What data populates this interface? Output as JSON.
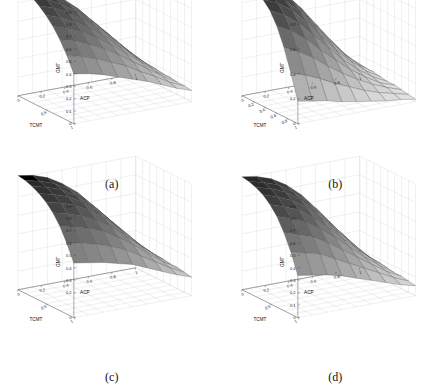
{
  "figure": {
    "background": "#ffffff",
    "layout": "2x2 grid of 3D surface plots",
    "panels": [
      {
        "caption": "(a)",
        "zlabel": "GMT",
        "xlabel": "ACP",
        "ylabel": "TCMT",
        "zticks": [
          "0",
          "0.1",
          "0.2",
          "0.3",
          "0.4",
          "0.5",
          "0.6",
          "0.7",
          "0.8",
          "0.9"
        ],
        "xticks": [
          "0",
          "0.2",
          "0.4",
          "0.6",
          "0.8",
          "1"
        ],
        "yticks": [
          "0.5",
          "1"
        ]
      },
      {
        "caption": "(b)",
        "zlabel": "GMT",
        "xlabel": "ACP",
        "ylabel": "TCMT",
        "zticks": [
          "0",
          "0.2",
          "0.4",
          "0.6",
          "0.8"
        ],
        "xticks": [
          "0",
          "0.2",
          "0.4",
          "0.6",
          "0.8",
          "1"
        ],
        "yticks": [
          "0.2",
          "0.4",
          "0.6",
          "0.8",
          "1"
        ]
      },
      {
        "caption": "(c)",
        "zlabel": "GMT",
        "xlabel": "ACP",
        "ylabel": "TCMT",
        "zticks": [
          "0",
          "0.2",
          "0.3",
          "0.4",
          "0.5",
          "0.6",
          "0.7",
          "0.8",
          "0.9"
        ],
        "xticks": [
          "0",
          "0.2",
          "0.4",
          "0.6",
          "0.8",
          "1"
        ],
        "yticks": [
          "0.5",
          "1"
        ]
      },
      {
        "caption": "(d)",
        "zlabel": "GMT",
        "xlabel": "ACP",
        "ylabel": "TCMT",
        "zticks": [
          "0",
          "0.1",
          "0.2",
          "0.3",
          "0.4",
          "0.5",
          "0.6",
          "0.7",
          "0.8",
          "0.9"
        ],
        "xticks": [
          "0",
          "0.2",
          "0.4",
          "0.6",
          "0.8",
          "1"
        ],
        "yticks": [
          "0.5",
          "1"
        ]
      }
    ]
  },
  "chart_data": [
    {
      "type": "surface",
      "panel": "(a)",
      "title": "",
      "xlabel": "ACP",
      "ylabel": "TCMT",
      "zlabel": "GMT",
      "xlim": [
        0,
        1
      ],
      "ylim": [
        0,
        1
      ],
      "zlim": [
        0,
        0.9
      ],
      "grid": true,
      "colormap": "gray",
      "x": [
        0,
        0.125,
        0.25,
        0.375,
        0.5,
        0.625,
        0.75,
        0.875,
        1
      ],
      "y": [
        0,
        0.125,
        0.25,
        0.375,
        0.5,
        0.625,
        0.75,
        0.875,
        1
      ],
      "z": [
        [
          0.9,
          0.86,
          0.8,
          0.72,
          0.62,
          0.5,
          0.38,
          0.25,
          0.14
        ],
        [
          0.88,
          0.84,
          0.78,
          0.7,
          0.6,
          0.48,
          0.36,
          0.24,
          0.13
        ],
        [
          0.85,
          0.81,
          0.75,
          0.67,
          0.57,
          0.46,
          0.34,
          0.22,
          0.12
        ],
        [
          0.81,
          0.77,
          0.71,
          0.63,
          0.54,
          0.43,
          0.32,
          0.21,
          0.12
        ],
        [
          0.76,
          0.72,
          0.66,
          0.59,
          0.5,
          0.4,
          0.3,
          0.2,
          0.11
        ],
        [
          0.7,
          0.66,
          0.61,
          0.54,
          0.46,
          0.37,
          0.28,
          0.18,
          0.11
        ],
        [
          0.62,
          0.59,
          0.54,
          0.48,
          0.41,
          0.33,
          0.25,
          0.17,
          0.1
        ],
        [
          0.52,
          0.49,
          0.45,
          0.4,
          0.35,
          0.28,
          0.22,
          0.15,
          0.1
        ],
        [
          0.4,
          0.38,
          0.35,
          0.31,
          0.27,
          0.23,
          0.18,
          0.13,
          0.09
        ]
      ]
    },
    {
      "type": "surface",
      "panel": "(b)",
      "title": "",
      "xlabel": "ACP",
      "ylabel": "TCMT",
      "zlabel": "GMT",
      "xlim": [
        0,
        1
      ],
      "ylim": [
        0,
        1
      ],
      "zlim": [
        0,
        0.9
      ],
      "grid": true,
      "colormap": "gray",
      "x": [
        0,
        0.125,
        0.25,
        0.375,
        0.5,
        0.625,
        0.75,
        0.875,
        1
      ],
      "y": [
        0,
        0.125,
        0.25,
        0.375,
        0.5,
        0.625,
        0.75,
        0.875,
        1
      ],
      "z": [
        [
          0.9,
          0.88,
          0.84,
          0.75,
          0.62,
          0.47,
          0.32,
          0.18,
          0.08
        ],
        [
          0.9,
          0.87,
          0.82,
          0.72,
          0.58,
          0.43,
          0.29,
          0.16,
          0.07
        ],
        [
          0.89,
          0.85,
          0.78,
          0.67,
          0.53,
          0.39,
          0.26,
          0.15,
          0.07
        ],
        [
          0.86,
          0.81,
          0.73,
          0.61,
          0.47,
          0.34,
          0.23,
          0.13,
          0.06
        ],
        [
          0.8,
          0.74,
          0.65,
          0.53,
          0.41,
          0.29,
          0.19,
          0.11,
          0.05
        ],
        [
          0.7,
          0.64,
          0.55,
          0.44,
          0.34,
          0.24,
          0.16,
          0.09,
          0.05
        ],
        [
          0.56,
          0.5,
          0.43,
          0.34,
          0.26,
          0.19,
          0.13,
          0.08,
          0.04
        ],
        [
          0.38,
          0.34,
          0.29,
          0.23,
          0.18,
          0.13,
          0.09,
          0.06,
          0.03
        ],
        [
          0.18,
          0.16,
          0.14,
          0.11,
          0.09,
          0.07,
          0.05,
          0.04,
          0.02
        ]
      ]
    },
    {
      "type": "surface",
      "panel": "(c)",
      "title": "",
      "xlabel": "ACP",
      "ylabel": "TCMT",
      "zlabel": "GMT",
      "xlim": [
        0,
        1
      ],
      "ylim": [
        0,
        1
      ],
      "zlim": [
        0,
        0.9
      ],
      "grid": true,
      "colormap": "gray",
      "x": [
        0,
        0.125,
        0.25,
        0.375,
        0.5,
        0.625,
        0.75,
        0.875,
        1
      ],
      "y": [
        0,
        0.125,
        0.25,
        0.375,
        0.5,
        0.625,
        0.75,
        0.875,
        1
      ],
      "z": [
        [
          0.92,
          0.9,
          0.86,
          0.79,
          0.7,
          0.58,
          0.45,
          0.32,
          0.2
        ],
        [
          0.91,
          0.88,
          0.84,
          0.77,
          0.68,
          0.56,
          0.43,
          0.3,
          0.19
        ],
        [
          0.89,
          0.86,
          0.82,
          0.75,
          0.65,
          0.54,
          0.41,
          0.29,
          0.19
        ],
        [
          0.86,
          0.83,
          0.79,
          0.72,
          0.63,
          0.52,
          0.4,
          0.28,
          0.18
        ],
        [
          0.82,
          0.79,
          0.75,
          0.68,
          0.6,
          0.5,
          0.38,
          0.27,
          0.18
        ],
        [
          0.76,
          0.73,
          0.69,
          0.63,
          0.56,
          0.46,
          0.36,
          0.26,
          0.17
        ],
        [
          0.68,
          0.65,
          0.62,
          0.57,
          0.5,
          0.42,
          0.33,
          0.24,
          0.17
        ],
        [
          0.57,
          0.55,
          0.52,
          0.48,
          0.43,
          0.36,
          0.29,
          0.22,
          0.16
        ],
        [
          0.44,
          0.42,
          0.4,
          0.37,
          0.34,
          0.29,
          0.24,
          0.19,
          0.15
        ]
      ]
    },
    {
      "type": "surface",
      "panel": "(d)",
      "title": "",
      "xlabel": "ACP",
      "ylabel": "TCMT",
      "zlabel": "GMT",
      "xlim": [
        0,
        1
      ],
      "ylim": [
        0,
        1
      ],
      "zlim": [
        0,
        0.9
      ],
      "grid": true,
      "colormap": "gray",
      "x": [
        0,
        0.125,
        0.25,
        0.375,
        0.5,
        0.625,
        0.75,
        0.875,
        1
      ],
      "y": [
        0,
        0.125,
        0.25,
        0.375,
        0.5,
        0.625,
        0.75,
        0.875,
        1
      ],
      "z": [
        [
          0.91,
          0.89,
          0.85,
          0.78,
          0.68,
          0.55,
          0.41,
          0.27,
          0.14
        ],
        [
          0.9,
          0.87,
          0.83,
          0.75,
          0.65,
          0.52,
          0.38,
          0.25,
          0.13
        ],
        [
          0.88,
          0.85,
          0.8,
          0.72,
          0.61,
          0.49,
          0.36,
          0.23,
          0.12
        ],
        [
          0.85,
          0.81,
          0.76,
          0.68,
          0.57,
          0.45,
          0.33,
          0.21,
          0.12
        ],
        [
          0.8,
          0.76,
          0.71,
          0.62,
          0.52,
          0.41,
          0.3,
          0.2,
          0.11
        ],
        [
          0.73,
          0.69,
          0.64,
          0.56,
          0.47,
          0.37,
          0.27,
          0.18,
          0.1
        ],
        [
          0.63,
          0.59,
          0.55,
          0.48,
          0.4,
          0.32,
          0.24,
          0.16,
          0.1
        ],
        [
          0.5,
          0.47,
          0.44,
          0.38,
          0.32,
          0.26,
          0.2,
          0.14,
          0.09
        ],
        [
          0.34,
          0.32,
          0.3,
          0.27,
          0.23,
          0.19,
          0.15,
          0.11,
          0.08
        ]
      ]
    }
  ]
}
